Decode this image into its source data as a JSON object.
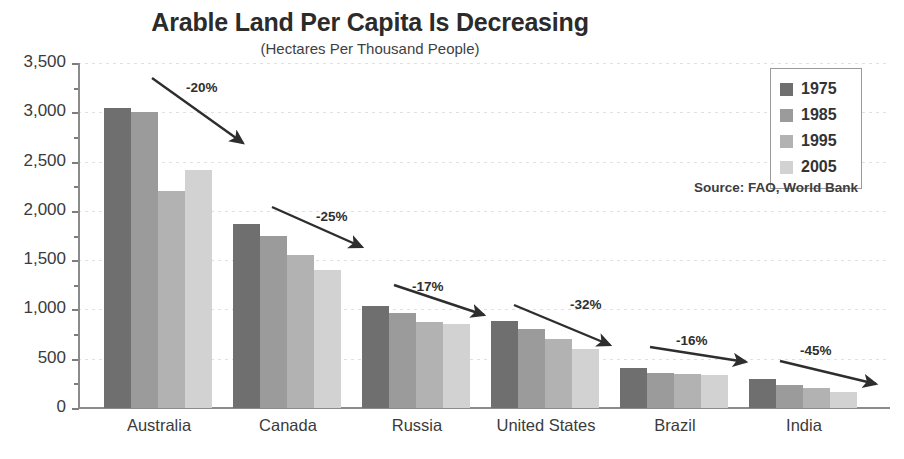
{
  "chart_data": {
    "type": "bar",
    "title": "Arable Land Per Capita Is Decreasing",
    "subtitle": "(Hectares Per Thousand People)",
    "xlabel": "",
    "ylabel": "",
    "ylim": [
      0,
      3500
    ],
    "ytick_step": 500,
    "grid": true,
    "legend_position": "top-right",
    "source": "Source: FAO, World Bank",
    "categories": [
      "Australia",
      "Canada",
      "Russia",
      "United States",
      "Brazil",
      "India"
    ],
    "ytick_labels": [
      "3,500",
      "3,000",
      "2,500",
      "2,000",
      "1,500",
      "1,000",
      "500",
      "0"
    ],
    "ytick_values": [
      3500,
      3000,
      2500,
      2000,
      1500,
      1000,
      500,
      0
    ],
    "series": [
      {
        "name": "1975",
        "color": "#6f6f6f",
        "values": [
          3040,
          1870,
          1040,
          880,
          410,
          290
        ]
      },
      {
        "name": "1985",
        "color": "#9b9b9b",
        "values": [
          3000,
          1750,
          960,
          800,
          355,
          235
        ]
      },
      {
        "name": "1995",
        "color": "#b2b2b2",
        "values": [
          2200,
          1555,
          870,
          700,
          350,
          200
        ]
      },
      {
        "name": "2005",
        "color": "#d2d2d2",
        "values": [
          2410,
          1405,
          850,
          600,
          330,
          160
        ]
      }
    ],
    "annotations": [
      {
        "label": "-20%",
        "category": "Australia"
      },
      {
        "label": "-25%",
        "category": "Canada"
      },
      {
        "label": "-17%",
        "category": "Russia"
      },
      {
        "label": "-32%",
        "category": "United States"
      },
      {
        "label": "-16%",
        "category": "Brazil"
      },
      {
        "label": "-45%",
        "category": "India"
      }
    ]
  },
  "legend": {
    "items": [
      {
        "label": "1975",
        "color": "#6f6f6f"
      },
      {
        "label": "1985",
        "color": "#9b9b9b"
      },
      {
        "label": "1995",
        "color": "#b2b2b2"
      },
      {
        "label": "2005",
        "color": "#d2d2d2"
      }
    ]
  }
}
